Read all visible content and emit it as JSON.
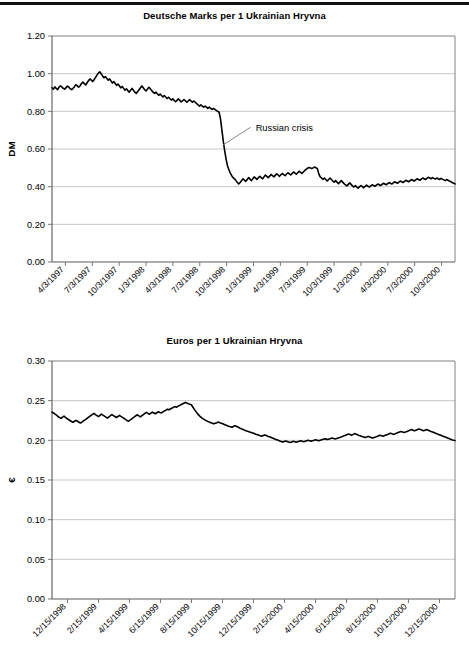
{
  "page": {
    "has_top_rule": true,
    "background_color": "#ffffff",
    "line_color": "#000000",
    "grid_color": "#b8b8b8"
  },
  "charts": [
    {
      "id": "dm-chart",
      "title": "Deutsche Marks per 1 Ukrainian Hryvna",
      "y_axis_title": "DM"
    },
    {
      "id": "eur-chart",
      "title": "Euros per 1 Ukrainian Hryvna",
      "y_axis_title": "€"
    }
  ],
  "annotations": {
    "russian_crisis": "Russian crisis"
  },
  "chart_data": [
    {
      "type": "line",
      "title": "Deutsche Marks per 1 Ukrainian Hryvna",
      "xlabel": "",
      "ylabel": "DM",
      "ylim": [
        0.0,
        1.2
      ],
      "ytick_labels": [
        "0.00",
        "0.20",
        "0.40",
        "0.60",
        "0.80",
        "1.00",
        "1.20"
      ],
      "ytick_values": [
        0.0,
        0.2,
        0.4,
        0.6,
        0.8,
        1.0,
        1.2
      ],
      "grid": true,
      "legend": "none",
      "xtick_labels": [
        "4/3/1997",
        "7/3/1997",
        "10/3/1997",
        "1/3/1998",
        "4/3/1998",
        "7/3/1998",
        "10/3/1998",
        "1/3/1999",
        "4/3/1999",
        "7/3/1999",
        "10/3/1999",
        "1/3/2000",
        "4/3/2000",
        "7/3/2000",
        "10/3/2000"
      ],
      "annotations": [
        {
          "text": "Russian crisis",
          "points_to_x_label": "10/3/1998",
          "points_to_y": 0.62
        }
      ],
      "series": [
        {
          "name": "DM per UAH",
          "values": [
            0.925,
            0.918,
            0.93,
            0.922,
            0.915,
            0.928,
            0.935,
            0.93,
            0.922,
            0.918,
            0.926,
            0.934,
            0.928,
            0.92,
            0.915,
            0.922,
            0.931,
            0.942,
            0.935,
            0.928,
            0.936,
            0.948,
            0.955,
            0.947,
            0.94,
            0.952,
            0.963,
            0.972,
            0.966,
            0.958,
            0.968,
            0.98,
            0.992,
            1.003,
            1.01,
            1.0,
            0.988,
            0.978,
            0.985,
            0.975,
            0.965,
            0.972,
            0.962,
            0.95,
            0.958,
            0.948,
            0.938,
            0.945,
            0.935,
            0.925,
            0.932,
            0.922,
            0.912,
            0.92,
            0.91,
            0.902,
            0.912,
            0.922,
            0.912,
            0.902,
            0.895,
            0.905,
            0.915,
            0.925,
            0.935,
            0.925,
            0.915,
            0.908,
            0.918,
            0.928,
            0.92,
            0.91,
            0.902,
            0.895,
            0.902,
            0.893,
            0.885,
            0.892,
            0.884,
            0.876,
            0.884,
            0.876,
            0.868,
            0.875,
            0.867,
            0.86,
            0.866,
            0.858,
            0.851,
            0.858,
            0.866,
            0.858,
            0.85,
            0.856,
            0.863,
            0.856,
            0.848,
            0.855,
            0.862,
            0.855,
            0.848,
            0.855,
            0.848,
            0.841,
            0.835,
            0.828,
            0.834,
            0.828,
            0.822,
            0.828,
            0.822,
            0.816,
            0.822,
            0.816,
            0.81,
            0.815,
            0.81,
            0.805,
            0.8,
            0.795,
            0.76,
            0.7,
            0.64,
            0.59,
            0.545,
            0.51,
            0.49,
            0.472,
            0.458,
            0.448,
            0.442,
            0.432,
            0.422,
            0.415,
            0.422,
            0.432,
            0.442,
            0.435,
            0.428,
            0.438,
            0.448,
            0.44,
            0.432,
            0.442,
            0.452,
            0.445,
            0.438,
            0.448,
            0.455,
            0.448,
            0.442,
            0.452,
            0.462,
            0.455,
            0.448,
            0.456,
            0.465,
            0.458,
            0.452,
            0.46,
            0.468,
            0.462,
            0.455,
            0.463,
            0.47,
            0.464,
            0.458,
            0.466,
            0.474,
            0.468,
            0.462,
            0.47,
            0.478,
            0.472,
            0.466,
            0.474,
            0.482,
            0.476,
            0.47,
            0.478,
            0.486,
            0.492,
            0.498,
            0.502,
            0.5,
            0.496,
            0.5,
            0.504,
            0.5,
            0.496,
            0.468,
            0.452,
            0.446,
            0.438,
            0.446,
            0.438,
            0.43,
            0.438,
            0.446,
            0.438,
            0.43,
            0.424,
            0.432,
            0.424,
            0.416,
            0.424,
            0.432,
            0.424,
            0.416,
            0.41,
            0.404,
            0.412,
            0.42,
            0.412,
            0.404,
            0.398,
            0.406,
            0.398,
            0.392,
            0.4,
            0.406,
            0.4,
            0.394,
            0.402,
            0.408,
            0.402,
            0.398,
            0.404,
            0.41,
            0.406,
            0.402,
            0.408,
            0.414,
            0.41,
            0.406,
            0.412,
            0.418,
            0.414,
            0.41,
            0.416,
            0.422,
            0.418,
            0.414,
            0.42,
            0.426,
            0.422,
            0.418,
            0.424,
            0.43,
            0.426,
            0.422,
            0.428,
            0.434,
            0.43,
            0.426,
            0.432,
            0.438,
            0.434,
            0.43,
            0.436,
            0.442,
            0.438,
            0.434,
            0.44,
            0.446,
            0.442,
            0.438,
            0.444,
            0.45,
            0.446,
            0.442,
            0.448,
            0.444,
            0.44,
            0.446,
            0.442,
            0.438,
            0.444,
            0.44,
            0.436,
            0.432,
            0.438,
            0.434,
            0.43,
            0.426,
            0.422,
            0.418,
            0.415
          ]
        }
      ]
    },
    {
      "type": "line",
      "title": "Euros per 1 Ukrainian Hryvna",
      "xlabel": "",
      "ylabel": "€",
      "ylim": [
        0.0,
        0.3
      ],
      "ytick_labels": [
        "0.00",
        "0.05",
        "0.10",
        "0.15",
        "0.20",
        "0.25",
        "0.30"
      ],
      "ytick_values": [
        0.0,
        0.05,
        0.1,
        0.15,
        0.2,
        0.25,
        0.3
      ],
      "grid": true,
      "legend": "none",
      "xtick_labels": [
        "12/15/1998",
        "2/15/1999",
        "4/15/1999",
        "6/15/1999",
        "8/15/1999",
        "10/15/1999",
        "12/15/1999",
        "2/15/2000",
        "4/15/2000",
        "6/15/2000",
        "8/15/2000",
        "10/15/2000",
        "12/15/2000"
      ],
      "series": [
        {
          "name": "EUR per UAH",
          "values": [
            0.2355,
            0.2345,
            0.233,
            0.2318,
            0.23,
            0.2288,
            0.2278,
            0.2292,
            0.2305,
            0.229,
            0.2275,
            0.2262,
            0.225,
            0.2238,
            0.2228,
            0.224,
            0.2252,
            0.224,
            0.2228,
            0.2218,
            0.223,
            0.2245,
            0.2258,
            0.227,
            0.2285,
            0.23,
            0.2315,
            0.2328,
            0.234,
            0.2325,
            0.2312,
            0.23,
            0.2315,
            0.233,
            0.2318,
            0.2305,
            0.2292,
            0.228,
            0.2295,
            0.231,
            0.2325,
            0.2312,
            0.23,
            0.2288,
            0.23,
            0.2315,
            0.2302,
            0.229,
            0.2278,
            0.2265,
            0.2252,
            0.224,
            0.2255,
            0.2268,
            0.2282,
            0.2295,
            0.231,
            0.2322,
            0.2308,
            0.2295,
            0.231,
            0.2325,
            0.234,
            0.2352,
            0.234,
            0.2328,
            0.2342,
            0.2355,
            0.2345,
            0.2335,
            0.2348,
            0.236,
            0.2352,
            0.2345,
            0.2358,
            0.237,
            0.238,
            0.2392,
            0.2385,
            0.2395,
            0.2405,
            0.2415,
            0.2425,
            0.2418,
            0.2428,
            0.2438,
            0.2448,
            0.2458,
            0.2468,
            0.2478,
            0.247,
            0.2462,
            0.2455,
            0.2448,
            0.242,
            0.239,
            0.2365,
            0.234,
            0.2318,
            0.2298,
            0.2282,
            0.227,
            0.2258,
            0.2248,
            0.2238,
            0.223,
            0.2222,
            0.2215,
            0.2208,
            0.2215,
            0.2222,
            0.223,
            0.2222,
            0.2215,
            0.2208,
            0.22,
            0.2192,
            0.2185,
            0.2178,
            0.2172,
            0.2165,
            0.2175,
            0.2185,
            0.2178,
            0.2168,
            0.2158,
            0.2148,
            0.214,
            0.2132,
            0.2125,
            0.2118,
            0.2112,
            0.2105,
            0.2098,
            0.2092,
            0.2085,
            0.2078,
            0.2072,
            0.2065,
            0.2058,
            0.2052,
            0.206,
            0.2068,
            0.206,
            0.2052,
            0.2045,
            0.2038,
            0.203,
            0.2022,
            0.2015,
            0.2008,
            0.2,
            0.1992,
            0.1985,
            0.1978,
            0.1985,
            0.1992,
            0.1985,
            0.1978,
            0.1972,
            0.198,
            0.1988,
            0.1982,
            0.1976,
            0.1982,
            0.1988,
            0.1994,
            0.1988,
            0.1982,
            0.1988,
            0.1994,
            0.2,
            0.1995,
            0.199,
            0.1996,
            0.2002,
            0.2008,
            0.2002,
            0.1996,
            0.2002,
            0.2008,
            0.2014,
            0.202,
            0.2015,
            0.201,
            0.2016,
            0.2022,
            0.2028,
            0.2022,
            0.2016,
            0.2022,
            0.2028,
            0.2035,
            0.2042,
            0.205,
            0.2058,
            0.2065,
            0.2072,
            0.208,
            0.2072,
            0.2065,
            0.2075,
            0.2085,
            0.2078,
            0.207,
            0.2062,
            0.2055,
            0.2048,
            0.2042,
            0.2035,
            0.2042,
            0.205,
            0.2042,
            0.2035,
            0.2028,
            0.2035,
            0.2042,
            0.205,
            0.2058,
            0.2065,
            0.2058,
            0.2052,
            0.206,
            0.2068,
            0.2075,
            0.2082,
            0.209,
            0.2082,
            0.2075,
            0.2082,
            0.209,
            0.2098,
            0.2105,
            0.2112,
            0.2105,
            0.2098,
            0.2105,
            0.2112,
            0.212,
            0.2128,
            0.2135,
            0.2128,
            0.212,
            0.2128,
            0.2135,
            0.2142,
            0.2135,
            0.2128,
            0.212,
            0.2128,
            0.2135,
            0.2128,
            0.212,
            0.2112,
            0.2105,
            0.2098,
            0.209,
            0.2082,
            0.2075,
            0.2068,
            0.206,
            0.2052,
            0.2045,
            0.2038,
            0.203,
            0.2022,
            0.2015,
            0.2008,
            0.2002,
            0.1998
          ]
        }
      ]
    }
  ]
}
